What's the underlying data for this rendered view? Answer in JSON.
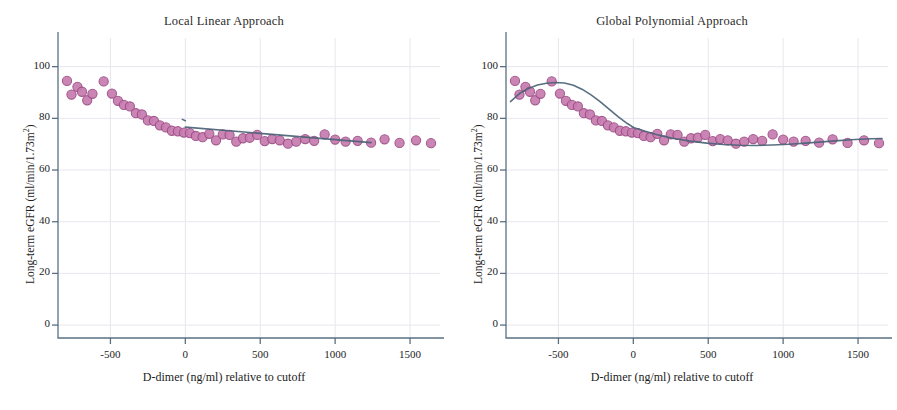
{
  "figure": {
    "panels": [
      {
        "id": "local-linear",
        "title": "Local Linear Approach",
        "xlabel": "D-dimer (ng/ml) relative to cutoff",
        "ylabel_main": "Long-term eGFR (ml/min/1.73m",
        "ylabel_sup": "2",
        "ylabel_tail": ")",
        "xticks": [
          "-500",
          "0",
          "500",
          "1000",
          "1500"
        ],
        "yticks": [
          "0",
          "20",
          "40",
          "60",
          "80",
          "100"
        ]
      },
      {
        "id": "global-polynomial",
        "title": "Global Polynomial Approach",
        "xlabel": "D-dimer (ng/ml) relative to cutoff",
        "ylabel_main": "Long-term eGFR (ml/min/1.73m",
        "ylabel_sup": "2",
        "ylabel_tail": ")",
        "xticks": [
          "-500",
          "0",
          "500",
          "1000",
          "1500"
        ],
        "yticks": [
          "0",
          "20",
          "40",
          "60",
          "80",
          "100"
        ]
      }
    ],
    "colors": {
      "marker_fill": "#c87cb0",
      "marker_edge": "#9c4f86",
      "fit_line": "#4a6377",
      "axis": "#5a7082",
      "grid": "#e9e6ee",
      "text": "#1c1c1c"
    }
  },
  "chart_data": [
    {
      "type": "scatter",
      "title": "Local Linear Approach",
      "xlabel": "D-dimer (ng/ml) relative to cutoff",
      "ylabel": "Long-term eGFR (ml/min/1.73m2)",
      "xlim": [
        -850,
        1700
      ],
      "ylim": [
        -5,
        108
      ],
      "xticks": [
        -500,
        0,
        500,
        1000,
        1500
      ],
      "yticks": [
        0,
        20,
        40,
        60,
        80,
        100
      ],
      "grid": true,
      "legend": "none",
      "series": [
        {
          "name": "binned means",
          "type": "scatter",
          "x": [
            -790,
            -760,
            -720,
            -690,
            -655,
            -620,
            -545,
            -490,
            -450,
            -410,
            -370,
            -330,
            -290,
            -250,
            -210,
            -170,
            -130,
            -90,
            -50,
            -10,
            30,
            70,
            115,
            160,
            205,
            250,
            295,
            340,
            385,
            430,
            480,
            530,
            580,
            630,
            685,
            740,
            800,
            860,
            930,
            1000,
            1070,
            1150,
            1240,
            1330,
            1430,
            1540,
            1640
          ],
          "y": [
            94.5,
            89.2,
            92.2,
            90.3,
            87.0,
            89.5,
            94.3,
            89.6,
            86.8,
            85.2,
            84.6,
            82.0,
            81.5,
            79.2,
            79.0,
            77.3,
            76.5,
            75.2,
            75.0,
            74.5,
            74.3,
            73.2,
            72.7,
            74.0,
            71.5,
            73.8,
            73.6,
            71.0,
            72.3,
            72.5,
            73.6,
            71.2,
            72.0,
            71.5,
            70.2,
            71.0,
            72.0,
            71.3,
            73.8,
            71.8,
            71.0,
            71.3,
            70.6,
            71.9,
            70.5,
            71.5,
            70.4
          ]
        },
        {
          "name": "local linear fit (left of cutoff)",
          "type": "line",
          "x": [
            -20,
            0
          ],
          "y": [
            79.6,
            79.1
          ]
        },
        {
          "name": "local linear fit (right of cutoff)",
          "type": "line",
          "x": [
            0,
            1240
          ],
          "y": [
            76.6,
            70.6
          ]
        }
      ]
    },
    {
      "type": "scatter",
      "title": "Global Polynomial Approach",
      "xlabel": "D-dimer (ng/ml) relative to cutoff",
      "ylabel": "Long-term eGFR (ml/min/1.73m2)",
      "xlim": [
        -850,
        1700
      ],
      "ylim": [
        -5,
        108
      ],
      "xticks": [
        -500,
        0,
        500,
        1000,
        1500
      ],
      "yticks": [
        0,
        20,
        40,
        60,
        80,
        100
      ],
      "grid": true,
      "legend": "none",
      "series": [
        {
          "name": "binned means",
          "type": "scatter",
          "x": [
            -790,
            -760,
            -720,
            -690,
            -655,
            -620,
            -545,
            -490,
            -450,
            -410,
            -370,
            -330,
            -290,
            -250,
            -210,
            -170,
            -130,
            -90,
            -50,
            -10,
            30,
            70,
            115,
            160,
            205,
            250,
            295,
            340,
            385,
            430,
            480,
            530,
            580,
            630,
            685,
            740,
            800,
            860,
            930,
            1000,
            1070,
            1150,
            1240,
            1330,
            1430,
            1540,
            1640
          ],
          "y": [
            94.5,
            89.2,
            92.2,
            90.3,
            87.0,
            89.5,
            94.3,
            89.6,
            86.8,
            85.2,
            84.6,
            82.0,
            81.5,
            79.2,
            79.0,
            77.3,
            76.5,
            75.2,
            75.0,
            74.5,
            74.3,
            73.2,
            72.7,
            74.0,
            71.5,
            73.8,
            73.6,
            71.0,
            72.3,
            72.5,
            73.6,
            71.2,
            72.0,
            71.5,
            70.2,
            71.0,
            72.0,
            71.3,
            73.8,
            71.8,
            71.0,
            71.3,
            70.6,
            71.9,
            70.5,
            71.5,
            70.4
          ]
        },
        {
          "name": "global polynomial fit (left of cutoff)",
          "type": "line",
          "x": [
            -820,
            -760,
            -700,
            -640,
            -580,
            -520,
            -460,
            -400,
            -340,
            -280,
            -220,
            -160,
            -100,
            -40,
            0
          ],
          "y": [
            86.5,
            89.6,
            91.6,
            92.9,
            93.6,
            93.9,
            93.7,
            92.8,
            91.2,
            89.0,
            86.4,
            83.5,
            80.6,
            78.0,
            76.5
          ]
        },
        {
          "name": "global polynomial fit (right of cutoff)",
          "type": "line",
          "x": [
            0,
            80,
            170,
            270,
            380,
            490,
            600,
            710,
            820,
            930,
            1040,
            1150,
            1260,
            1370,
            1480,
            1590,
            1660
          ],
          "y": [
            76.5,
            75.0,
            73.5,
            72.2,
            71.2,
            70.4,
            69.9,
            69.6,
            69.5,
            69.7,
            70.0,
            70.4,
            70.9,
            71.4,
            71.8,
            72.1,
            72.2
          ]
        }
      ]
    }
  ]
}
